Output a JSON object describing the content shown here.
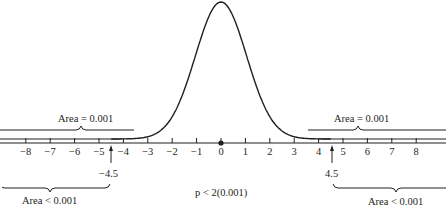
{
  "chart_data": {
    "type": "line",
    "title": "",
    "xlabel": "",
    "ylabel": "",
    "xlim": [
      -8.9,
      9.0
    ],
    "x_ticks": [
      -8,
      -7,
      -6,
      -5,
      -4,
      -3,
      -2,
      -1,
      0,
      1,
      2,
      3,
      4,
      5,
      6,
      7,
      8
    ],
    "x_tick_labels": [
      "−8",
      "−7",
      "−6",
      "−5",
      "−4",
      "−3",
      "−2",
      "−1",
      "0",
      "1",
      "2",
      "3",
      "4",
      "5",
      "6",
      "7",
      "8"
    ],
    "series": [
      {
        "name": "standard normal density",
        "function": "N(0,1)",
        "peak_x": 0
      }
    ],
    "center_point": {
      "x": 0,
      "marker": "dot"
    },
    "markers": [
      {
        "x": -4.5,
        "label": "−4.5",
        "type": "arrow-up"
      },
      {
        "x": 4.5,
        "label": "4.5",
        "type": "arrow-up"
      }
    ],
    "annotations": [
      {
        "text": "Area = 0.001",
        "region": "left tail beyond −3.1",
        "position": "upper-left"
      },
      {
        "text": "Area = 0.001",
        "region": "right tail beyond 3.1",
        "position": "upper-right"
      },
      {
        "text": "Area < 0.001",
        "region": "left of −4.5",
        "position": "lower-left"
      },
      {
        "text": "Area < 0.001",
        "region": "right of 4.5",
        "position": "lower-right"
      },
      {
        "text": "p < 2(0.001)",
        "position": "bottom-center"
      }
    ],
    "grid": false,
    "legend": "none"
  },
  "labels": {
    "area_upper_left": "Area = 0.001",
    "area_upper_right": "Area = 0.001",
    "area_lower_left": "Area < 0.001",
    "area_lower_right": "Area < 0.001",
    "marker_left": "−4.5",
    "marker_right": "4.5",
    "p_value": "p < 2(0.001)"
  },
  "colors": {
    "ink": "#231f20",
    "background": "#ffffff"
  }
}
